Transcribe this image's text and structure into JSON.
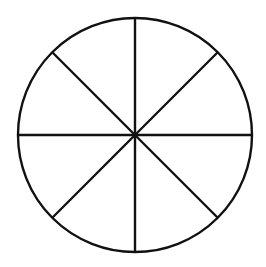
{
  "diagram": {
    "type": "circle-divided-into-sectors",
    "sectors": 8,
    "center": [
      135,
      135
    ],
    "radius": 117,
    "stroke_color": "#111111",
    "background_color": "#ffffff",
    "stroke_width": 2.4,
    "divider_angles_deg": [
      0,
      45,
      90,
      135
    ]
  }
}
